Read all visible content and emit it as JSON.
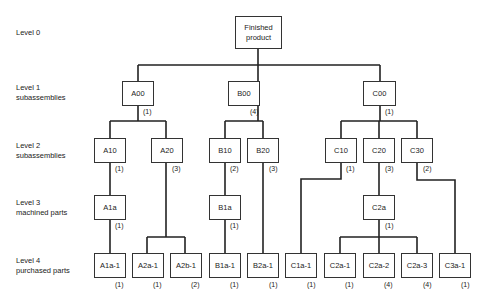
{
  "levels": [
    {
      "line1": "Level 0",
      "line2": ""
    },
    {
      "line1": "Level 1",
      "line2": "subassemblies"
    },
    {
      "line1": "Level 2",
      "line2": "subassemblies"
    },
    {
      "line1": "Level 3",
      "line2": "machined parts"
    },
    {
      "line1": "Level 4",
      "line2": "purchased parts"
    }
  ],
  "root": {
    "line1": "Finished",
    "line2": "product"
  },
  "nodes": {
    "A00": {
      "label": "A00",
      "qty": "(1)"
    },
    "B00": {
      "label": "B00",
      "qty": "(4)"
    },
    "C00": {
      "label": "C00",
      "qty": "(1)"
    },
    "A10": {
      "label": "A10",
      "qty": "(1)"
    },
    "A20": {
      "label": "A20",
      "qty": "(3)"
    },
    "B10": {
      "label": "B10",
      "qty": "(2)"
    },
    "B20": {
      "label": "B20",
      "qty": "(3)"
    },
    "C10": {
      "label": "C10",
      "qty": "(1)"
    },
    "C20": {
      "label": "C20",
      "qty": "(3)"
    },
    "C30": {
      "label": "C30",
      "qty": "(2)"
    },
    "A1a": {
      "label": "A1a",
      "qty": "(1)"
    },
    "B1a": {
      "label": "B1a",
      "qty": "(1)"
    },
    "C2a": {
      "label": "C2a",
      "qty": "(1)"
    },
    "A1a1": {
      "label": "A1a-1",
      "qty": "(1)"
    },
    "A2a1": {
      "label": "A2a-1",
      "qty": "(1)"
    },
    "A2b1": {
      "label": "A2b-1",
      "qty": "(2)"
    },
    "B1a1": {
      "label": "B1a-1",
      "qty": "(1)"
    },
    "B2a1": {
      "label": "B2a-1",
      "qty": "(1)"
    },
    "C1a1": {
      "label": "C1a-1",
      "qty": "(1)"
    },
    "C2a1": {
      "label": "C2a-1",
      "qty": "(1)"
    },
    "C2a2": {
      "label": "C2a-2",
      "qty": "(4)"
    },
    "C2a3": {
      "label": "C2a-3",
      "qty": "(4)"
    },
    "C3a1": {
      "label": "C3a-1",
      "qty": "(1)"
    }
  }
}
